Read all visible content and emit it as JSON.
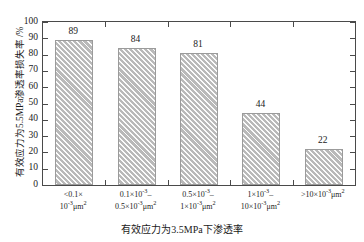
{
  "chart_data": {
    "type": "bar",
    "title": "",
    "xlabel": "有效应力为3.5MPa下渗透率",
    "ylabel": "有效应力为5.5MPa渗透率损失率 /%",
    "categories": [
      "<0.1×10⁻³μm²",
      "0.1×10⁻³–0.5×10⁻³μm²",
      "0.5×10⁻³–1×10⁻³μm²",
      "1×10⁻³–10×10⁻³μm²",
      ">10×10⁻³μm²"
    ],
    "category_lines": [
      [
        "<0.1×",
        "10",
        "μm",
        ""
      ],
      [
        "0.1×10",
        "0.5×10",
        "μm"
      ],
      [
        "0.5×10",
        "1×10",
        "μm"
      ],
      [
        "1×10",
        "10×10",
        "μm"
      ],
      [
        ">10×10",
        "μm"
      ]
    ],
    "values": [
      89,
      84,
      81,
      44,
      22
    ],
    "value_labels": [
      "89",
      "84",
      "81",
      "44",
      "22"
    ],
    "ylim": [
      0,
      100
    ],
    "yticks": [
      "0",
      "10",
      "20",
      "30",
      "40",
      "50",
      "60",
      "70",
      "80",
      "90",
      "100"
    ],
    "ytick_values": [
      0,
      10,
      20,
      30,
      40,
      50,
      60,
      70,
      80,
      90,
      100
    ],
    "grid": false,
    "legend": false,
    "bar_fill_color": "#b9b9b9",
    "bar_edge_color": "#9b9b9b",
    "axis_color": "#4a4a4a",
    "text_color": "#1a1a1a",
    "background": "#ffffff"
  },
  "xtick_labels": [
    {
      "line1_pre": "<0.1",
      "line1_times": "×",
      "line1_post": "",
      "line2_base": "10",
      "line2_exp": "-3",
      "line2_unit": "μm",
      "line2_unit_exp": "2"
    },
    {
      "line1_pre": "0.1",
      "line1_times": "×",
      "line1_post": "10",
      "line1_exp": "-3",
      "line1_dash": "–",
      "line2_pre": "0.5",
      "line2_times": "×",
      "line2_base": "10",
      "line2_exp": "-3",
      "line2_unit": "μm",
      "line2_unit_exp": "2"
    },
    {
      "line1_pre": "0.5",
      "line1_times": "×",
      "line1_post": "10",
      "line1_exp": "-3",
      "line1_dash": "–",
      "line2_pre": "1",
      "line2_times": "×",
      "line2_base": "10",
      "line2_exp": "-3",
      "line2_unit": "μm",
      "line2_unit_exp": "2"
    },
    {
      "line1_pre": "1",
      "line1_times": "×",
      "line1_post": "10",
      "line1_exp": "-3",
      "line1_dash": "–",
      "line2_pre": "10",
      "line2_times": "×",
      "line2_base": "10",
      "line2_exp": "-3",
      "line2_unit": "μm",
      "line2_unit_exp": "2"
    },
    {
      "line1_pre": ">10",
      "line1_times": "×",
      "line1_post": "10",
      "line1_exp": "-3",
      "line1_unit": "μm",
      "line1_unit_exp": "2"
    }
  ]
}
